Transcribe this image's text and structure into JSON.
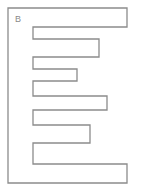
{
  "diagram": {
    "label": "B",
    "stroke_color": "#8c8c8c",
    "fill_color": "#ffffff",
    "outline_points": "8,8 127,8 127,27 33,27 33,39 99,39 99,57 33,57 33,69 77,69 77,81 33,81 33,96 107,96 107,110 33,110 33,125 90,125 90,143 33,143 33,164 127,164 127,183 8,183"
  }
}
